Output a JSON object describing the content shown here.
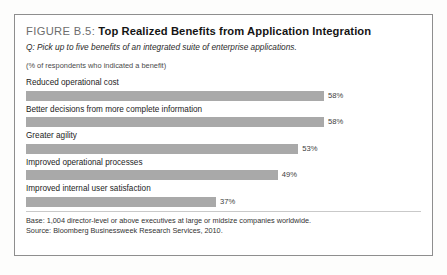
{
  "figure": {
    "label": "FIGURE B.5:",
    "title": "Top Realized Benefits from Application Integration",
    "question": "Q: Pick up to five benefits of an integrated suite of enterprise applications.",
    "unit_note": "(% of respondents who indicated a benefit)",
    "base": "Base: 1,004 director-level or above executives at large or midsize companies worldwide.",
    "source": "Source: Bloomberg Businessweek Research Services, 2010.",
    "bar_color": "#a9a9a9",
    "border_color": "#8e8e8e"
  },
  "chart_data": {
    "type": "bar",
    "orientation": "horizontal",
    "title": "Top Realized Benefits from Application Integration",
    "subtitle": "Q: Pick up to five benefits of an integrated suite of enterprise applications.",
    "xlabel": "(% of respondents who indicated a benefit)",
    "ylabel": "",
    "xlim": [
      0,
      58
    ],
    "grid": false,
    "legend": "none",
    "categories": [
      "Reduced operational cost",
      "Better decisions from more complete information",
      "Greater agility",
      "Improved operational processes",
      "Improved internal user satisfaction"
    ],
    "values": [
      58,
      58,
      53,
      49,
      37
    ],
    "value_labels": [
      "58%",
      "58%",
      "53%",
      "49%",
      "37%"
    ],
    "bars": [
      {
        "label": "Reduced operational cost",
        "value": 58,
        "value_label": "58%",
        "pct_width": 100.0
      },
      {
        "label": "Better decisions from more complete information",
        "value": 58,
        "value_label": "58%",
        "pct_width": 100.0
      },
      {
        "label": "Greater agility",
        "value": 53,
        "value_label": "53%",
        "pct_width": 91.4
      },
      {
        "label": "Improved operational processes",
        "value": 49,
        "value_label": "49%",
        "pct_width": 84.5
      },
      {
        "label": "Improved internal user satisfaction",
        "value": 37,
        "value_label": "37%",
        "pct_width": 63.8
      }
    ]
  }
}
